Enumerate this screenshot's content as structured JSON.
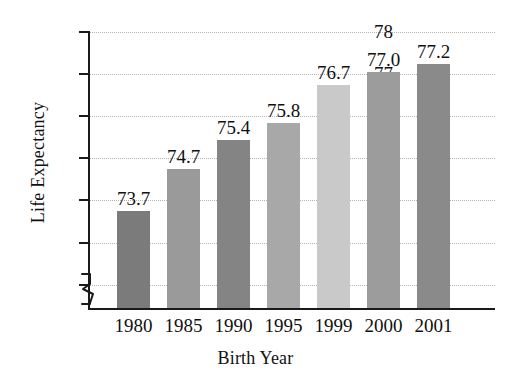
{
  "chart_data": {
    "type": "bar",
    "title": "",
    "xlabel": "Birth Year",
    "ylabel": "Life Expectancy",
    "categories": [
      "1980",
      "1985",
      "1990",
      "1995",
      "1999",
      "2000",
      "2001"
    ],
    "values": [
      73.7,
      74.7,
      75.4,
      75.8,
      76.7,
      77.0,
      77.2
    ],
    "value_labels": [
      "73.7",
      "74.7",
      "75.4",
      "75.8",
      "76.7",
      "77.0",
      "77.2"
    ],
    "bar_colors": [
      "#7b7b7b",
      "#9a9a9a",
      "#848484",
      "#a8a8a8",
      "#c9c9c9",
      "#9c9c9c",
      "#8a8a8a"
    ],
    "ylim": [
      71.4,
      78
    ],
    "y_ticks": [
      "72",
      "73",
      "74",
      "75",
      "76",
      "77",
      "78"
    ],
    "y_tick_values": [
      72,
      73,
      74,
      75,
      76,
      77,
      78
    ],
    "grid": true,
    "grid_color": "#b4b4b4",
    "axis_color": "#1a1a1a",
    "axis_break": true,
    "legend": "none",
    "background": "#ffffff"
  }
}
